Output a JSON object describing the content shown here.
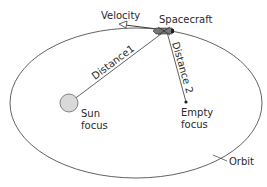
{
  "diagram": {
    "labels": {
      "velocity": "Velocity",
      "spacecraft": "Spacecraft",
      "distance1": "Distance1",
      "distance2": "Distance 2",
      "sun_line1": "Sun",
      "sun_line2": "focus",
      "empty_line1": "Empty",
      "empty_line2": "focus",
      "orbit": "Orbit"
    },
    "colors": {
      "line": "#3a3a3a",
      "sun_fill": "#d9d9d9",
      "background": "#ffffff"
    }
  }
}
